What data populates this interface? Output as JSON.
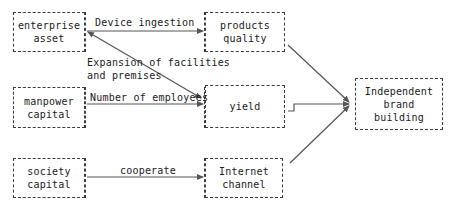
{
  "diagram": {
    "nodes": [
      {
        "id": "enterprise-asset",
        "label": "enterprise\nasset",
        "x": 13,
        "y": 12,
        "w": 72,
        "h": 40
      },
      {
        "id": "products-quality",
        "label": "products\nquality",
        "x": 205,
        "y": 12,
        "w": 80,
        "h": 40
      },
      {
        "id": "manpower-capital",
        "label": "manpower\ncapital",
        "x": 13,
        "y": 87,
        "w": 72,
        "h": 41
      },
      {
        "id": "yield",
        "label": "yield",
        "x": 205,
        "y": 85,
        "w": 80,
        "h": 43
      },
      {
        "id": "society-capital",
        "label": "society\ncapital",
        "x": 13,
        "y": 158,
        "w": 72,
        "h": 40
      },
      {
        "id": "internet-channel",
        "label": "Internet\nchannel",
        "x": 205,
        "y": 158,
        "w": 78,
        "h": 40
      },
      {
        "id": "independent-brand-building",
        "label": "Independent\nbrand\nbuilding",
        "x": 355,
        "y": 78,
        "w": 88,
        "h": 52
      }
    ],
    "edge_labels": [
      {
        "id": "device-ingestion",
        "text": "Device ingestion",
        "x": 95,
        "y": 16
      },
      {
        "id": "expansion-of-facilities",
        "text": "Expansion of facilities\nand premises",
        "x": 87,
        "y": 56
      },
      {
        "id": "number-of-employees",
        "text": "Number of employees",
        "x": 90,
        "y": 91
      },
      {
        "id": "cooperate",
        "text": "cooperate",
        "x": 120,
        "y": 164
      }
    ],
    "mid_frames": [
      {
        "id": "frame-top",
        "x": 85,
        "y": 12,
        "w": 120,
        "h": 40
      },
      {
        "id": "frame-middle",
        "x": 85,
        "y": 87,
        "w": 120,
        "h": 41
      },
      {
        "id": "frame-bottom",
        "x": 85,
        "y": 158,
        "w": 120,
        "h": 40
      }
    ],
    "colors": {
      "box_border": "#3b3b3b",
      "line": "#555555",
      "text": "#1a1a1a",
      "background": "#ffffff"
    }
  }
}
